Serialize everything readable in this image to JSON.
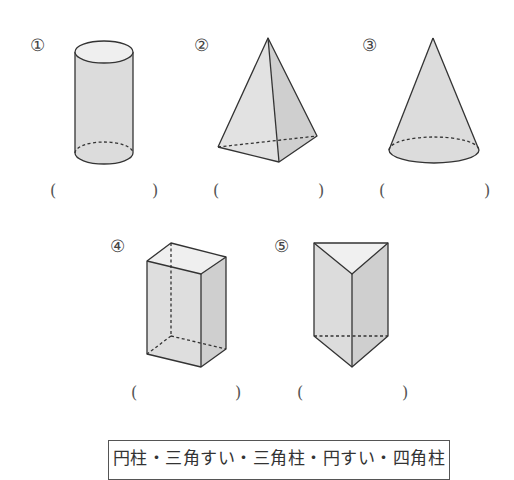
{
  "problems": [
    {
      "number": "①",
      "shape": "cylinder",
      "open_paren": "(",
      "close_paren": ")"
    },
    {
      "number": "②",
      "shape": "square-pyramid",
      "open_paren": "(",
      "close_paren": ")"
    },
    {
      "number": "③",
      "shape": "cone",
      "open_paren": "(",
      "close_paren": ")"
    },
    {
      "number": "④",
      "shape": "rectangular-prism",
      "open_paren": "(",
      "close_paren": ")"
    },
    {
      "number": "⑤",
      "shape": "triangular-prism",
      "open_paren": "(",
      "close_paren": ")"
    }
  ],
  "answer_choices": "円柱・三角すい・三角柱・円すい・四角柱",
  "colors": {
    "fill": "#e3e3e3",
    "fill_dark": "#cfcfcf",
    "fill_light": "#efefef",
    "stroke": "#333333"
  }
}
